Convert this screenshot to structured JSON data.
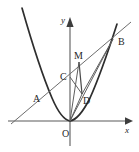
{
  "figure": {
    "background_color": "#ffffff",
    "width": 139,
    "height": 152,
    "curve_color": "#2e2e2e",
    "line_color": "#6d6d6d",
    "axis_color": "#5a5a5a",
    "label_color": "#1f1f1f"
  },
  "axes": {
    "x_label": "x",
    "y_label": "y",
    "origin_label": "O",
    "x_axis": {
      "x1": 8,
      "y1": 121,
      "x2": 128,
      "y2": 121
    },
    "y_axis": {
      "x1": 70,
      "y1": 144,
      "x2": 70,
      "y2": 19
    },
    "x_label_pos": {
      "x": 126,
      "y": 133
    },
    "y_label_pos": {
      "x": 62,
      "y": 22
    },
    "origin_label_pos": {
      "x": 63,
      "y": 136
    }
  },
  "points": [
    {
      "name": "A",
      "label": "A",
      "x": 41,
      "y": 99,
      "label_x": 33,
      "label_y": 102
    },
    {
      "name": "B",
      "label": "B",
      "x": 113,
      "y": 39,
      "label_x": 118,
      "label_y": 45
    },
    {
      "name": "C",
      "label": "C",
      "x": 70,
      "y": 77,
      "label_x": 61,
      "label_y": 79
    },
    {
      "name": "M",
      "label": "M",
      "x": 79,
      "y": 62,
      "label_x": 75,
      "label_y": 59
    },
    {
      "name": "D",
      "label": "D",
      "x": 82,
      "y": 94,
      "label_x": 83,
      "label_y": 103
    },
    {
      "name": "O",
      "label": "O",
      "x": 70,
      "y": 121,
      "label_x": 63,
      "label_y": 136
    }
  ],
  "curves": [
    {
      "name": "parabola",
      "equation": "y = a x^2",
      "vertex": {
        "x": 70,
        "y": 121
      },
      "description": "upward opening parabola through O, A and B"
    }
  ],
  "segments": [
    {
      "name": "chord-AB",
      "from": "A",
      "to": "B",
      "style": "chord",
      "extended": true
    },
    {
      "name": "segment-OB",
      "from": "O",
      "to": "B",
      "style": "seg"
    },
    {
      "name": "segment-OD",
      "from": "O",
      "to": "D",
      "style": "seg"
    },
    {
      "name": "segment-OC",
      "from": "O",
      "to": "C",
      "style": "seg"
    },
    {
      "name": "segment-OM",
      "from": "O",
      "to": "M",
      "style": "seg"
    },
    {
      "name": "segment-MD",
      "from": "M",
      "to": "D",
      "style": "seg-strong"
    },
    {
      "name": "segment-CD",
      "from": "C",
      "to": "D",
      "style": "seg"
    },
    {
      "name": "segment-DB",
      "from": "D",
      "to": "B",
      "style": "seg"
    }
  ]
}
